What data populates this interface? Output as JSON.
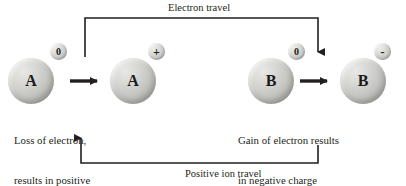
{
  "diagram": {
    "title_top": "Electron travel",
    "title_bottom": "Positive ion travel",
    "background_color": "#ffffff",
    "line_color": "#231f20",
    "text_color": "#231f20",
    "sphere_color": "#c3c3c0"
  },
  "atoms": [
    {
      "id": "atom-a-neutral",
      "letter": "A",
      "charge": "0",
      "charge_name": "neutral"
    },
    {
      "id": "atom-a-positive",
      "letter": "A",
      "charge": "+",
      "charge_name": "positive"
    },
    {
      "id": "atom-b-neutral",
      "letter": "B",
      "charge": "0",
      "charge_name": "neutral"
    },
    {
      "id": "atom-b-negative",
      "letter": "-",
      "charge": "-",
      "charge_name": "negative"
    }
  ],
  "atom_letters": {
    "a1": "A",
    "a2": "A",
    "b1": "B",
    "b2": "B"
  },
  "charges": {
    "a1": "0",
    "a2": "+",
    "b1": "0",
    "b2": "-"
  },
  "captions": {
    "left_line1": "Loss of electron,",
    "left_line2": "results in positive",
    "left_line3": "charge",
    "right_line1": "Gain of electron results",
    "right_line2": "in negative charge"
  }
}
